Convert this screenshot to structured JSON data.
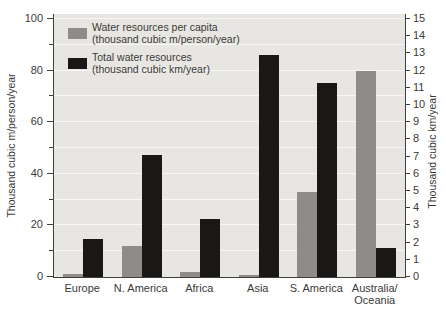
{
  "chart_data": {
    "type": "bar",
    "title": "",
    "categories": [
      "Europe",
      "N. America",
      "Africa",
      "Asia",
      "S. America",
      "Australia/Oceania"
    ],
    "series": [
      {
        "name": "Water resources per capita",
        "units": "thousand cubic m/person/year",
        "axis": "left",
        "color": "#8e8b88",
        "values": [
          1,
          12,
          2,
          0.7,
          33,
          80
        ]
      },
      {
        "name": "Total water resources",
        "units": "thousand cubic km/year",
        "axis": "right",
        "color": "#1a1816",
        "values": [
          2.2,
          7.1,
          3.4,
          12.9,
          11.3,
          1.7
        ]
      }
    ],
    "left_axis": {
      "label": "Thousand cubic m/person/year",
      "min": 0,
      "max": 100,
      "label_step": 20,
      "tick_step": 10
    },
    "right_axis": {
      "label": "Thousand cubic km/year",
      "min": 0,
      "max": 15,
      "label_step": 1,
      "tick_step": 1
    },
    "legend": {
      "position": "top-left",
      "items": [
        {
          "line1": "Water resources per capita",
          "line2": "(thousand cubic m/person/year)",
          "color": "#8e8b88"
        },
        {
          "line1": "Total water resources",
          "line2": "(thousand cubic km/year)",
          "color": "#1a1816"
        }
      ]
    },
    "grid": {
      "orientation": "horizontal",
      "step_left_units": 10,
      "color": "#f8f7f5"
    },
    "colors": {
      "plot_bg": "#e8e6e3",
      "axis": "#403e3c",
      "text": "#3b3a37"
    }
  }
}
